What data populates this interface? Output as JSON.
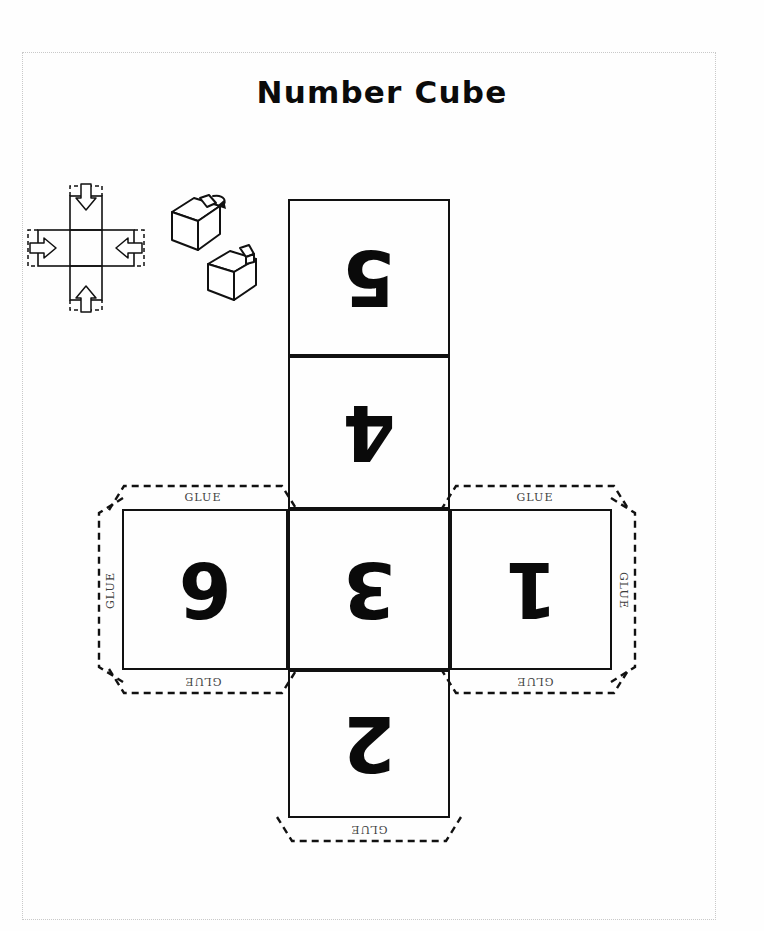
{
  "page": {
    "title": "Number Cube",
    "border_color": "#c9c9c9",
    "ink_color": "#111111",
    "glue_text_color": "#3d3d3d"
  },
  "instructions": {
    "net_fold_icon_name": "cube-net-fold-arrows-icon",
    "open_cube_icon_name": "open-cube-with-tab-icon",
    "closed_cube_icon_name": "assembled-cube-icon"
  },
  "net": {
    "faces": [
      {
        "id": "face-5",
        "digit": "5",
        "column": "center",
        "row": 1,
        "rotated": true
      },
      {
        "id": "face-4",
        "digit": "4",
        "column": "center",
        "row": 2,
        "rotated": true
      },
      {
        "id": "face-6",
        "digit": "6",
        "column": "left",
        "row": 3,
        "rotated": true
      },
      {
        "id": "face-3",
        "digit": "3",
        "column": "center",
        "row": 3,
        "rotated": true
      },
      {
        "id": "face-1",
        "digit": "1",
        "column": "right",
        "row": 3,
        "rotated": true
      },
      {
        "id": "face-2",
        "digit": "2",
        "column": "center",
        "row": 4,
        "rotated": true
      }
    ],
    "glue_label": "GLUE",
    "glue_tabs": [
      {
        "id": "tab-left-top",
        "label": "GLUE",
        "orientation": "horizontal",
        "flipped": false
      },
      {
        "id": "tab-left-side",
        "label": "GLUE",
        "orientation": "vertical-left",
        "flipped": false
      },
      {
        "id": "tab-left-bottom",
        "label": "GLUE",
        "orientation": "horizontal",
        "flipped": true
      },
      {
        "id": "tab-right-top",
        "label": "GLUE",
        "orientation": "horizontal",
        "flipped": false
      },
      {
        "id": "tab-right-side",
        "label": "GLUE",
        "orientation": "vertical-right",
        "flipped": false
      },
      {
        "id": "tab-right-bottom",
        "label": "GLUE",
        "orientation": "horizontal",
        "flipped": true
      },
      {
        "id": "tab-center-bottom",
        "label": "GLUE",
        "orientation": "horizontal",
        "flipped": true
      }
    ]
  }
}
